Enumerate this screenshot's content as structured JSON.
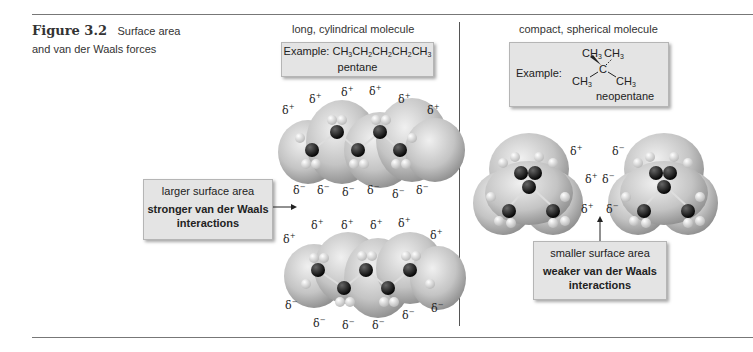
{
  "figure": {
    "number": "Figure 3.2",
    "caption_line1": "Surface area",
    "caption_line2": "and van der Waals forces"
  },
  "left_panel": {
    "heading": "long, cylindrical molecule",
    "example_label": "Example:",
    "example_formula": [
      "CH",
      "3",
      "CH",
      "2",
      "CH",
      "2",
      "CH",
      "2",
      "CH",
      "3"
    ],
    "example_name": "pentane",
    "callout_line1": "larger surface area",
    "callout_line2": "stronger van der Waals",
    "callout_line3": "interactions",
    "top_molecule_deltas_top": [
      "δ+",
      "δ+",
      "δ+",
      "δ+",
      "δ+",
      "δ+",
      "δ+"
    ],
    "top_molecule_deltas_bottom": [
      "δ−",
      "δ−",
      "δ−",
      "δ−",
      "δ−",
      "δ−"
    ],
    "bottom_molecule_deltas_top": [
      "δ+",
      "δ+",
      "δ+",
      "δ+",
      "δ+",
      "δ+"
    ],
    "bottom_molecule_deltas_bottom": [
      "δ−",
      "δ−",
      "δ−",
      "δ−",
      "δ−",
      "δ−"
    ]
  },
  "right_panel": {
    "heading": "compact, spherical molecule",
    "example_label": "Example:",
    "structure_labels": [
      "CH3",
      "CH3",
      "C",
      "CH3",
      "CH3"
    ],
    "example_name": "neopentane",
    "callout_line1": "smaller surface area",
    "callout_line2": "weaker van der Waals",
    "callout_line3": "interactions",
    "left_molecule_deltas": [
      "δ+",
      "δ+",
      "δ+"
    ],
    "right_molecule_deltas": [
      "δ−",
      "δ−",
      "δ−"
    ]
  },
  "colors": {
    "box_bg": "#e4e4e4",
    "surface": "#c8c8c8",
    "carbon": "#111111",
    "hydrogen": "#e8e8e8",
    "rule": "#777777"
  }
}
